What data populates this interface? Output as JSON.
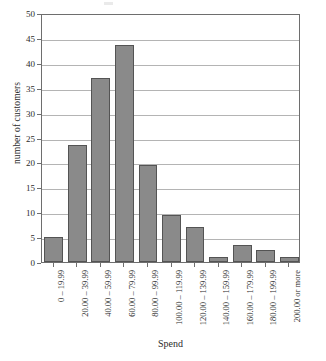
{
  "chart_data": {
    "type": "bar",
    "title": "",
    "xlabel": "Spend",
    "ylabel": "number of customers",
    "categories": [
      "0 – 19.99",
      "20.00 – 39.99",
      "40.00 – 59.99",
      "60.00 – 79.99",
      "80.00 – 99.99",
      "100.00 – 119.99",
      "120.00 – 139.99",
      "140.00 – 159.99",
      "160.00 – 179.99",
      "180.00 – 199.99",
      "200.00 or more"
    ],
    "values": [
      5,
      23.5,
      37,
      43.5,
      19.5,
      9.5,
      7,
      1,
      3.5,
      2.5,
      1
    ],
    "ylim": [
      0,
      50
    ],
    "ytick_labels": [
      "0",
      "5",
      "10",
      "15",
      "20",
      "25",
      "30",
      "35",
      "40",
      "45",
      "50"
    ],
    "ytick_values": [
      0,
      5,
      10,
      15,
      20,
      25,
      30,
      35,
      40,
      45,
      50
    ],
    "grid": "horizontal",
    "legend": "none",
    "bar_color": "#8a8a8a",
    "bar_edge_color": "#545454",
    "gridline_color": "#b4b4b4",
    "frame_color": "#6e6e6e"
  }
}
